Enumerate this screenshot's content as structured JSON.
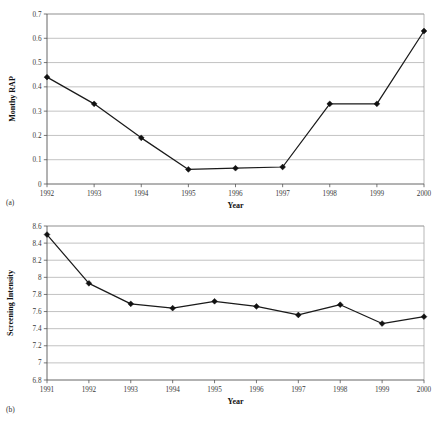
{
  "figure": {
    "background": "#ffffff",
    "line_color": "#111111",
    "grid_color": "#a8a8a8",
    "panels": [
      {
        "label": "(a)",
        "name": "panel-a"
      },
      {
        "label": "(b)",
        "name": "panel-b"
      }
    ]
  },
  "chart_data": [
    {
      "type": "line",
      "panel_label": "(a)",
      "title": "",
      "xlabel": "Year",
      "ylabel": "Monthy RAP",
      "categories": [
        "1992",
        "1993",
        "1994",
        "1995",
        "1996",
        "1997",
        "1998",
        "1999",
        "2000"
      ],
      "values": [
        0.44,
        0.33,
        0.19,
        0.06,
        0.065,
        0.07,
        0.33,
        0.33,
        0.63
      ],
      "yticks": [
        0,
        0.1,
        0.2,
        0.3,
        0.4,
        0.5,
        0.6,
        0.7
      ],
      "ytick_labels": [
        "0",
        "0.1",
        "0.2",
        "0.3",
        "0.4",
        "0.5",
        "0.6",
        "0.7"
      ],
      "ylim": [
        0,
        0.7
      ],
      "grid": true,
      "grid_axis": "y",
      "legend": false,
      "marker": "diamond"
    },
    {
      "type": "line",
      "panel_label": "(b)",
      "title": "",
      "xlabel": "Year",
      "ylabel": "Screening Intensity",
      "categories": [
        "1991",
        "1992",
        "1993",
        "1994",
        "1995",
        "1996",
        "1997",
        "1998",
        "1999",
        "2000"
      ],
      "values": [
        8.5,
        7.93,
        7.69,
        7.64,
        7.72,
        7.66,
        7.56,
        7.68,
        7.46,
        7.54
      ],
      "yticks": [
        6.8,
        7,
        7.2,
        7.4,
        7.6,
        7.8,
        8,
        8.2,
        8.4,
        8.6
      ],
      "ytick_labels": [
        "6.8",
        "7",
        "7.2",
        "7.4",
        "7.6",
        "7.8",
        "8",
        "8.2",
        "8.4",
        "8.6"
      ],
      "ylim": [
        6.8,
        8.6
      ],
      "grid": true,
      "grid_axis": "y",
      "legend": false,
      "marker": "diamond"
    }
  ]
}
